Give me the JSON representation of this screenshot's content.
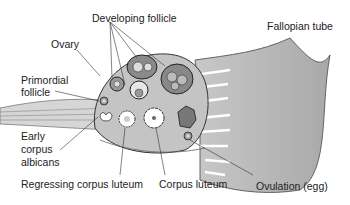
{
  "diagram": {
    "labels": {
      "developing_follicle": "Developing follicle",
      "ovary": "Ovary",
      "primordial_follicle_1": "Primordial",
      "primordial_follicle_2": "follicle",
      "early_corpus_1": "Early",
      "early_corpus_2": "corpus",
      "early_corpus_3": "albicans",
      "regressing_corpus_luteum": "Regressing corpus luteum",
      "corpus_luteum": "Corpus luteum",
      "ovulation": "Ovulation (egg)",
      "fallopian_tube": "Fallopian tube"
    },
    "colors": {
      "tissue_dark": "#8a8a8a",
      "tissue_mid": "#b5b5b5",
      "tissue_light": "#d8d8d8",
      "outline": "#333333"
    }
  }
}
